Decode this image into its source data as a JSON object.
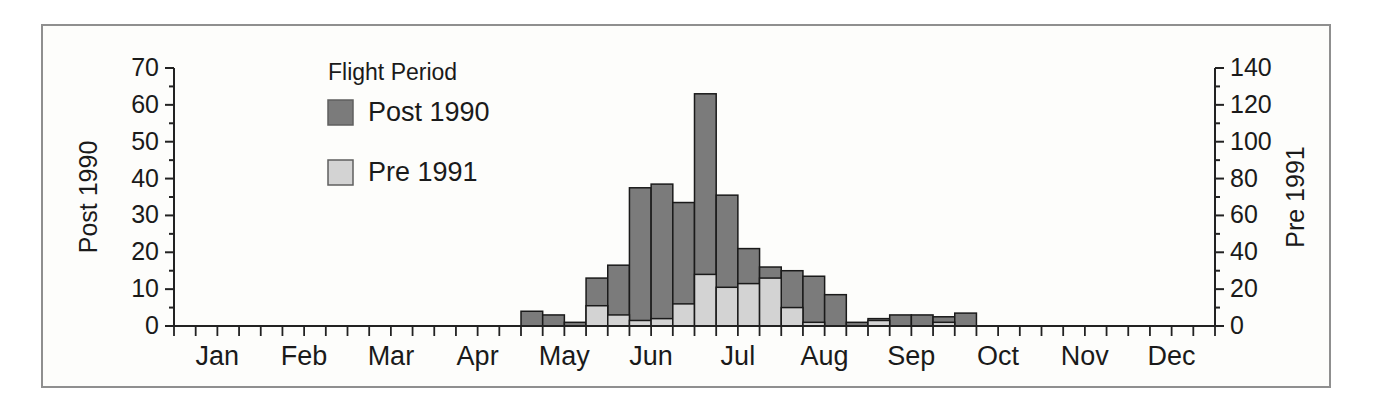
{
  "figure": {
    "legend_title": "Flight Period"
  },
  "chart_data": {
    "type": "bar",
    "title": "",
    "legend_title": "Flight Period",
    "legend_position": "upper-left",
    "grid": false,
    "months": [
      "Jan",
      "Feb",
      "Mar",
      "Apr",
      "May",
      "Jun",
      "Jul",
      "Aug",
      "Sep",
      "Oct",
      "Nov",
      "Dec"
    ],
    "bars_per_month": 4,
    "x_unit": "week of year",
    "left_axis": {
      "label": "Post 1990",
      "min": 0,
      "max": 70,
      "major_step": 10,
      "minor_step": 5
    },
    "right_axis": {
      "label": "Pre 1991",
      "min": 0,
      "max": 140,
      "major_step": 20,
      "minor_step": 10
    },
    "colors": {
      "post": "#7b7b7b",
      "pre": "#d3d3d3",
      "outline": "#1a1a1a",
      "axis": "#222222",
      "legend_title": "#5a5a5a"
    },
    "series": [
      {
        "name": "Post 1990",
        "axis": "left",
        "color": "#7b7b7b",
        "values": [
          0,
          0,
          0,
          0,
          0,
          0,
          0,
          0,
          0,
          0,
          0,
          0,
          0,
          0,
          0,
          0,
          4,
          3,
          1,
          13,
          16.5,
          37.5,
          38.5,
          33.5,
          63,
          35.5,
          21,
          16,
          15,
          13.5,
          8.5,
          1,
          2,
          3,
          3,
          2.5,
          3.5,
          0,
          0,
          0,
          0,
          0,
          0,
          0,
          0,
          0,
          0,
          0
        ]
      },
      {
        "name": "Pre 1991",
        "axis": "right",
        "color": "#d3d3d3",
        "values": [
          0,
          0,
          0,
          0,
          0,
          0,
          0,
          0,
          0,
          0,
          0,
          0,
          0,
          0,
          0,
          0,
          0,
          0,
          0,
          11,
          6,
          3,
          4,
          12,
          28,
          21,
          23,
          26,
          10,
          2,
          0,
          0,
          3,
          0,
          0,
          2,
          0,
          0,
          0,
          0,
          0,
          0,
          0,
          0,
          0,
          0,
          0,
          0
        ]
      }
    ]
  }
}
